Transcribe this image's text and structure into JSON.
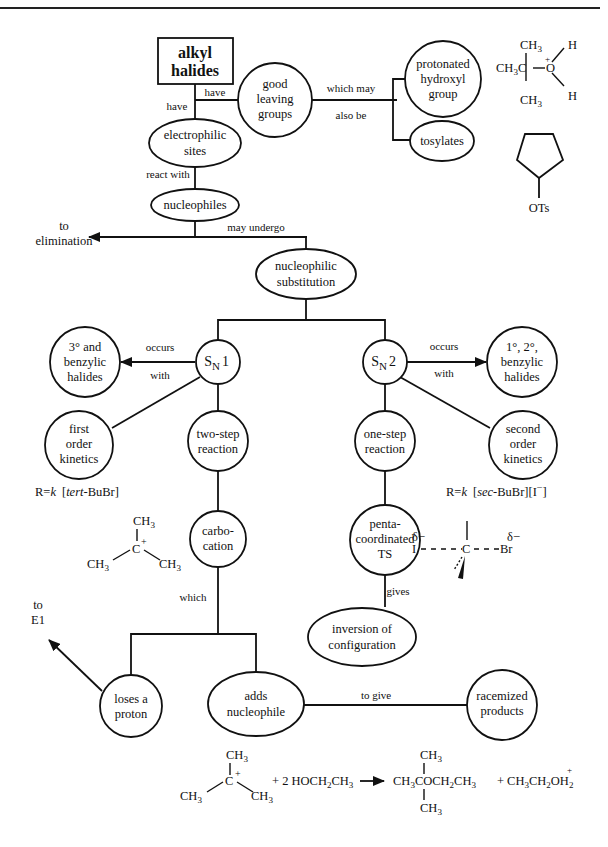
{
  "header": {
    "rule": true
  },
  "nodes": {
    "alkyl_halides": [
      "alkyl",
      "halides"
    ],
    "good_leaving_groups": [
      "good",
      "leaving",
      "groups"
    ],
    "protonated_hydroxyl_group": [
      "protonated",
      "hydroxyl",
      "group"
    ],
    "tosylates": [
      "tosylates"
    ],
    "electrophilic_sites": [
      "electrophilic",
      "sites"
    ],
    "nucleophiles": [
      "nucleophiles"
    ],
    "nucleophilic_substitution": [
      "nucleophilic",
      "substitution"
    ],
    "sn1": {
      "main": "S",
      "sub": "N",
      "num": "1"
    },
    "sn2": {
      "main": "S",
      "sub": "N",
      "num": "2"
    },
    "tertiary_benzylic": [
      "3° and",
      "benzylic",
      "halides"
    ],
    "primary_secondary_benzylic": [
      "1°, 2°,",
      "benzylic",
      "halides"
    ],
    "first_order": [
      "first",
      "order",
      "kinetics"
    ],
    "two_step": [
      "two-step",
      "reaction"
    ],
    "one_step": [
      "one-step",
      "reaction"
    ],
    "second_order": [
      "second",
      "order",
      "kinetics"
    ],
    "carbocation": [
      "carbo-",
      "cation"
    ],
    "pentacoordinated_ts": [
      "penta-",
      "coordinated",
      "TS"
    ],
    "inversion": [
      "inversion of",
      "configuration"
    ],
    "loses_proton": [
      "loses a",
      "proton"
    ],
    "adds_nucleophile": [
      "adds",
      "nucleophile"
    ],
    "racemized": [
      "racemized",
      "products"
    ]
  },
  "edge_labels": {
    "have_1": "have",
    "have_2": "have",
    "which_may": "which may",
    "also_be": "also be",
    "react_with": "react with",
    "may_undergo": "may undergo",
    "to_elimination": [
      "to",
      "elimination"
    ],
    "occurs_1": "occurs",
    "with_1": "with",
    "occurs_2": "occurs",
    "with_2": "with",
    "which": "which",
    "gives": "gives",
    "to_e1": [
      "to",
      "E1"
    ],
    "to_give": "to give"
  },
  "rate_laws": {
    "sn1": {
      "prefix": "R=",
      "k": "k",
      "bracket": "[tert-BuBr]",
      "italic": "tert",
      "rest": "-BuBr]"
    },
    "sn2": {
      "prefix": "R=",
      "k": "k",
      "italic": "sec",
      "rest": "-BuBr][I",
      "charge": "−",
      "close": "]"
    }
  },
  "structures": {
    "oxonium": {
      "ch3_top": "CH",
      "ch3_left": "CH",
      "c": "C",
      "o": "O",
      "h": "H",
      "plus": "+",
      "three": "3"
    },
    "cyclopentyl_tosylate": {
      "label": "OTs"
    },
    "tbutyl_cation": {
      "ch": "CH",
      "three": "3",
      "c": "C",
      "plus": "+"
    },
    "transition_state": {
      "delta": "δ−",
      "i": "I",
      "c": "C",
      "br": "Br"
    },
    "equation": {
      "reagent": "+ 2 HOCH",
      "reagent_sub": "2",
      "reagent_end": "CH",
      "three": "3",
      "product1_left": "CH",
      "product1_mid": "COCH",
      "product1_end": "CH",
      "plus": "+",
      "product2_a": "CH",
      "product2_b": "CH",
      "product2_o": "OH",
      "two": "2"
    }
  }
}
